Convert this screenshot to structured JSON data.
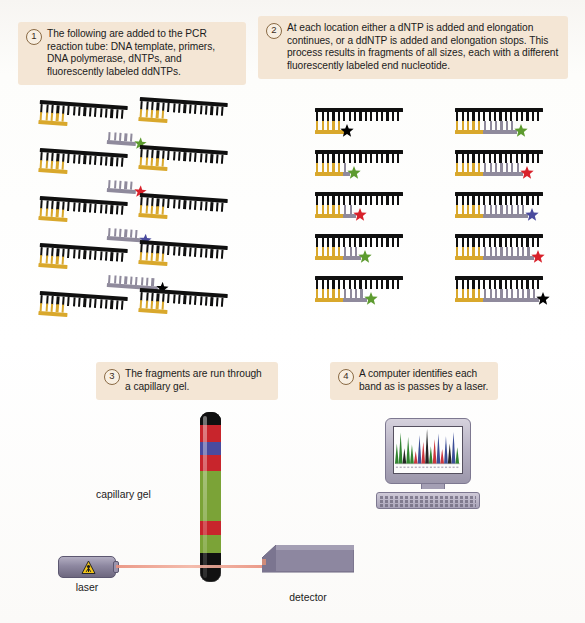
{
  "figure": {
    "background": "#ffffff",
    "callout_bg": "#f4e6d5"
  },
  "steps": [
    {
      "number": "1",
      "text": "The following are added to the PCR reaction tube: DNA template, primers, DNA polymerase, dNTPs, and fluorescently labeled ddNTPs."
    },
    {
      "number": "2",
      "text": "At each location either a dNTP is added and elongation continues, or a ddNTP is added and elongation stops. This process results in fragments of all sizes, each with a different fluorescently labeled end nucleotide."
    },
    {
      "number": "3",
      "text": "The fragments are run through a capillary gel."
    },
    {
      "number": "4",
      "text": "A computer identifies each band as is passes by a laser."
    }
  ],
  "colors": {
    "template_strand": "#101010",
    "primer_strand": "#d9a82c",
    "extension_strand": "#8f8a9c",
    "star_green": "#5d9b2f",
    "star_red": "#d8212a",
    "star_blue": "#4a4b9e",
    "star_black": "#000000",
    "laser_beam": "#e98f7c",
    "apparatus_gray": "#8d87a0",
    "warning_yellow": "#f2c419"
  },
  "panel1": {
    "name": "reaction components",
    "fragments": [
      {
        "row": 0,
        "col": 0,
        "template_teeth": 16,
        "primer_teeth": 5,
        "extension_teeth": 0,
        "star": null
      },
      {
        "row": 0,
        "col": 1,
        "template_teeth": 16,
        "primer_teeth": 5,
        "extension_teeth": 0,
        "star": null
      },
      {
        "row": 0,
        "col": 2,
        "template_teeth": 0,
        "primer_teeth": 0,
        "extension_teeth": 5,
        "star": "star_green"
      },
      {
        "row": 1,
        "col": 0,
        "template_teeth": 16,
        "primer_teeth": 5,
        "extension_teeth": 0,
        "star": null
      },
      {
        "row": 1,
        "col": 1,
        "template_teeth": 16,
        "primer_teeth": 5,
        "extension_teeth": 0,
        "star": null
      },
      {
        "row": 1,
        "col": 2,
        "template_teeth": 0,
        "primer_teeth": 0,
        "extension_teeth": 5,
        "star": "star_red"
      },
      {
        "row": 2,
        "col": 0,
        "template_teeth": 16,
        "primer_teeth": 5,
        "extension_teeth": 0,
        "star": null
      },
      {
        "row": 2,
        "col": 1,
        "template_teeth": 16,
        "primer_teeth": 5,
        "extension_teeth": 0,
        "star": null
      },
      {
        "row": 2,
        "col": 2,
        "template_teeth": 0,
        "primer_teeth": 0,
        "extension_teeth": 6,
        "star": "star_blue"
      },
      {
        "row": 3,
        "col": 0,
        "template_teeth": 16,
        "primer_teeth": 5,
        "extension_teeth": 0,
        "star": null
      },
      {
        "row": 3,
        "col": 1,
        "template_teeth": 16,
        "primer_teeth": 5,
        "extension_teeth": 0,
        "star": null
      },
      {
        "row": 3,
        "col": 2,
        "template_teeth": 0,
        "primer_teeth": 0,
        "extension_teeth": 9,
        "star": "star_black"
      },
      {
        "row": 4,
        "col": 0,
        "template_teeth": 16,
        "primer_teeth": 5,
        "extension_teeth": 0,
        "star": null
      },
      {
        "row": 4,
        "col": 1,
        "template_teeth": 16,
        "primer_teeth": 5,
        "extension_teeth": 0,
        "star": null
      }
    ]
  },
  "panel2": {
    "name": "terminated fragments of increasing length",
    "fragments": [
      {
        "row": 0,
        "col": 0,
        "template_teeth": 16,
        "primer_len": 5,
        "extension_len": 0,
        "star": "star_black"
      },
      {
        "row": 0,
        "col": 1,
        "template_teeth": 16,
        "primer_len": 5,
        "extension_len": 6,
        "star": "star_green"
      },
      {
        "row": 1,
        "col": 0,
        "template_teeth": 16,
        "primer_len": 5,
        "extension_len": 1,
        "star": "star_green"
      },
      {
        "row": 1,
        "col": 1,
        "template_teeth": 16,
        "primer_len": 5,
        "extension_len": 7,
        "star": "star_red"
      },
      {
        "row": 2,
        "col": 0,
        "template_teeth": 16,
        "primer_len": 5,
        "extension_len": 2,
        "star": "star_red"
      },
      {
        "row": 2,
        "col": 1,
        "template_teeth": 16,
        "primer_len": 5,
        "extension_len": 8,
        "star": "star_blue"
      },
      {
        "row": 3,
        "col": 0,
        "template_teeth": 16,
        "primer_len": 5,
        "extension_len": 3,
        "star": "star_green"
      },
      {
        "row": 3,
        "col": 1,
        "template_teeth": 16,
        "primer_len": 5,
        "extension_len": 9,
        "star": "star_red"
      },
      {
        "row": 4,
        "col": 0,
        "template_teeth": 16,
        "primer_len": 5,
        "extension_len": 4,
        "star": "star_green"
      },
      {
        "row": 4,
        "col": 1,
        "template_teeth": 16,
        "primer_len": 5,
        "extension_len": 10,
        "star": "star_black"
      }
    ]
  },
  "panel3": {
    "gel_label": "capillary gel",
    "laser_label": "laser",
    "detector_label": "detector",
    "gel_bands": [
      {
        "color": "#101010",
        "height": 13
      },
      {
        "color": "#c8252c",
        "height": 17
      },
      {
        "color": "#4a4b9e",
        "height": 13
      },
      {
        "color": "#c8252c",
        "height": 16
      },
      {
        "color": "#7ba337",
        "height": 17
      },
      {
        "color": "#7ba337",
        "height": 16
      },
      {
        "color": "#7ba337",
        "height": 17
      },
      {
        "color": "#c8252c",
        "height": 14
      },
      {
        "color": "#7ba337",
        "height": 18
      },
      {
        "color": "#101010",
        "height": 13
      }
    ]
  },
  "panel4": {
    "chromatogram_peaks": [
      {
        "x": 3,
        "h": 22,
        "color": "#1f7a1f"
      },
      {
        "x": 7,
        "h": 34,
        "color": "#1f7a1f"
      },
      {
        "x": 11,
        "h": 17,
        "color": "#111111"
      },
      {
        "x": 15,
        "h": 29,
        "color": "#1f7a1f"
      },
      {
        "x": 19,
        "h": 21,
        "color": "#1f7a1f"
      },
      {
        "x": 23,
        "h": 14,
        "color": "#c8252c"
      },
      {
        "x": 27,
        "h": 31,
        "color": "#2b3f8f"
      },
      {
        "x": 31,
        "h": 24,
        "color": "#c8252c"
      },
      {
        "x": 35,
        "h": 38,
        "color": "#111111"
      },
      {
        "x": 39,
        "h": 19,
        "color": "#1f7a1f"
      },
      {
        "x": 43,
        "h": 27,
        "color": "#c8252c"
      },
      {
        "x": 47,
        "h": 33,
        "color": "#2b3f8f"
      },
      {
        "x": 51,
        "h": 16,
        "color": "#c8252c"
      },
      {
        "x": 55,
        "h": 30,
        "color": "#2b3f8f"
      },
      {
        "x": 59,
        "h": 22,
        "color": "#111111"
      },
      {
        "x": 63,
        "h": 35,
        "color": "#2b3f8f"
      },
      {
        "x": 67,
        "h": 18,
        "color": "#1f7a1f"
      }
    ]
  }
}
